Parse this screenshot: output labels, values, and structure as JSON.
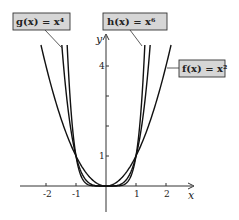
{
  "chart_data": {
    "type": "line",
    "title": "",
    "xlabel": "x",
    "ylabel": "y",
    "xlim": [
      -2.8,
      2.4
    ],
    "ylim": [
      -1.0,
      4.9
    ],
    "grid": false,
    "x_ticks": [
      -2,
      -1,
      1,
      2
    ],
    "x_tick_labels": [
      "-2",
      "-1",
      "1",
      "2"
    ],
    "y_ticks": [
      1,
      2,
      3,
      4
    ],
    "y_tick_labels": [
      "1",
      "",
      "",
      "4"
    ],
    "series": [
      {
        "name": "f(x) = x²",
        "exponent": 2,
        "x": [
          -2.2,
          -2,
          -1.5,
          -1,
          -0.5,
          0,
          0.5,
          1,
          1.5,
          2,
          2.2
        ],
        "values": [
          4.84,
          4,
          2.25,
          1,
          0.25,
          0,
          0.25,
          1,
          2.25,
          4,
          4.84
        ]
      },
      {
        "name": "g(x) = x⁴",
        "exponent": 4,
        "x": [
          -1.47,
          -1.25,
          -1,
          -0.5,
          0,
          0.5,
          1,
          1.25,
          1.47
        ],
        "values": [
          4.67,
          2.44,
          1,
          0.0625,
          0,
          0.0625,
          1,
          2.44,
          4.67
        ]
      },
      {
        "name": "h(x) = x⁶",
        "exponent": 6,
        "x": [
          -1.29,
          -1.15,
          -1,
          -0.5,
          0,
          0.5,
          1,
          1.15,
          1.29
        ],
        "values": [
          4.61,
          2.31,
          1,
          0.0156,
          0,
          0.0156,
          1,
          2.31,
          4.61
        ]
      }
    ],
    "annotations": [
      {
        "text": "g(x) = x⁴",
        "points_to": "g"
      },
      {
        "text": "h(x) = x⁶",
        "points_to": "h"
      },
      {
        "text": "f(x) = x²",
        "points_to": "f"
      }
    ],
    "legend_position": "callout boxes"
  },
  "labels": {
    "g": "g(x) = x⁴",
    "h": "h(x) = x⁶",
    "f": "f(x) = x²",
    "x_axis": "x",
    "y_axis": "y",
    "tick_neg2": "-2",
    "tick_neg1": "-1",
    "tick_1": "1",
    "tick_2": "2",
    "ytick_1": "1",
    "ytick_4": "4"
  },
  "colors": {
    "curve": "#111111",
    "label_fill": "#d6d6d6",
    "label_border": "#333333"
  }
}
